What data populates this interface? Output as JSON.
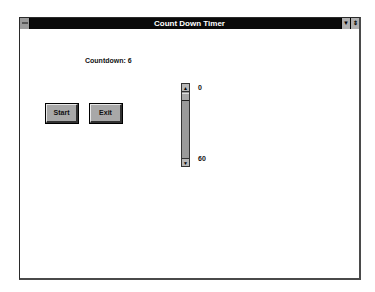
{
  "window": {
    "title": "Count Down Timer",
    "controls": {
      "minimize_icon": "down-arrow-icon",
      "maximize_icon": "up-down-arrow-icon"
    }
  },
  "main": {
    "countdown_label": "Countdown: 6",
    "start_button": "Start",
    "exit_button": "Exit",
    "scrollbar": {
      "min_label": "0",
      "max_label": "60",
      "orientation": "vertical"
    }
  },
  "colors": {
    "titlebar": "#0a0a0a",
    "button_face": "#a8a8a8",
    "scrollbar_track": "#9a9a9a"
  }
}
